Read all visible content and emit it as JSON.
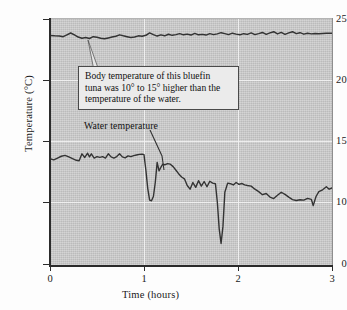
{
  "chart_data": {
    "type": "line",
    "title": "",
    "xlabel": "Time (hours)",
    "ylabel": "Temperature (°C)",
    "xlim": [
      0,
      3
    ],
    "ylim": [
      0,
      25
    ],
    "y_axis_break": true,
    "xticks": [
      "0",
      "1",
      "2",
      "3"
    ],
    "yticks": [
      "0",
      "10",
      "15",
      "20",
      "25"
    ],
    "grid": "white gridlines at y=10,15,20 and x=1,2",
    "legend": "none (inline labels)",
    "plot_background": "#c9c9c9",
    "line_color": "#333333",
    "series": [
      {
        "name": "Body temperature",
        "x": [
          0.0,
          0.05,
          0.1,
          0.14,
          0.18,
          0.22,
          0.26,
          0.3,
          0.34,
          0.38,
          0.42,
          0.46,
          0.5,
          0.54,
          0.58,
          0.62,
          0.66,
          0.7,
          0.74,
          0.78,
          0.82,
          0.86,
          0.9,
          0.94,
          0.98,
          1.02,
          1.06,
          1.1,
          1.14,
          1.18,
          1.22,
          1.26,
          1.3,
          1.34,
          1.38,
          1.42,
          1.46,
          1.5,
          1.54,
          1.58,
          1.62,
          1.66,
          1.7,
          1.74,
          1.78,
          1.82,
          1.86,
          1.9,
          1.94,
          1.98,
          2.02,
          2.06,
          2.1,
          2.14,
          2.18,
          2.22,
          2.26,
          2.3,
          2.34,
          2.38,
          2.42,
          2.46,
          2.5,
          2.54,
          2.58,
          2.62,
          2.66,
          2.7,
          2.74,
          2.78,
          2.82,
          2.86,
          2.9,
          2.94,
          3.0
        ],
        "y": [
          23.65,
          23.62,
          23.6,
          23.55,
          23.7,
          23.85,
          23.7,
          23.52,
          23.42,
          23.48,
          23.4,
          23.55,
          23.5,
          23.42,
          23.38,
          23.45,
          23.52,
          23.58,
          23.7,
          23.62,
          23.55,
          23.48,
          23.52,
          23.62,
          23.58,
          23.66,
          23.86,
          23.72,
          23.6,
          23.7,
          23.62,
          23.75,
          23.66,
          23.72,
          23.8,
          23.7,
          23.76,
          23.68,
          23.82,
          23.7,
          23.74,
          23.68,
          23.8,
          23.72,
          23.78,
          23.88,
          23.8,
          23.72,
          23.84,
          23.76,
          23.7,
          23.8,
          23.74,
          23.86,
          23.72,
          23.8,
          23.9,
          23.74,
          23.86,
          23.96,
          23.78,
          23.9,
          23.74,
          23.86,
          23.96,
          23.8,
          23.88,
          23.76,
          23.84,
          23.78,
          23.82,
          23.8,
          23.82,
          23.84,
          23.84
        ]
      },
      {
        "name": "Water temperature",
        "x": [
          0.0,
          0.04,
          0.08,
          0.12,
          0.16,
          0.2,
          0.24,
          0.28,
          0.31,
          0.34,
          0.37,
          0.4,
          0.42,
          0.44,
          0.47,
          0.5,
          0.53,
          0.56,
          0.59,
          0.62,
          0.65,
          0.68,
          0.71,
          0.74,
          0.77,
          0.8,
          0.83,
          0.86,
          0.89,
          0.92,
          0.95,
          0.98,
          1.0,
          1.02,
          1.04,
          1.06,
          1.08,
          1.1,
          1.12,
          1.14,
          1.16,
          1.18,
          1.2,
          1.22,
          1.25,
          1.28,
          1.31,
          1.34,
          1.37,
          1.4,
          1.43,
          1.46,
          1.49,
          1.52,
          1.55,
          1.58,
          1.61,
          1.64,
          1.67,
          1.7,
          1.73,
          1.76,
          1.78,
          1.8,
          1.82,
          1.84,
          1.86,
          1.89,
          1.92,
          1.95,
          1.98,
          2.01,
          2.04,
          2.07,
          2.1,
          2.14,
          2.18,
          2.22,
          2.26,
          2.3,
          2.34,
          2.38,
          2.42,
          2.46,
          2.5,
          2.54,
          2.58,
          2.62,
          2.66,
          2.7,
          2.74,
          2.78,
          2.8,
          2.83,
          2.86,
          2.9,
          2.94,
          2.97,
          3.0
        ],
        "y": [
          13.55,
          13.45,
          13.6,
          13.75,
          13.82,
          13.7,
          13.55,
          13.42,
          13.38,
          13.95,
          13.65,
          14.0,
          13.7,
          13.95,
          13.6,
          13.72,
          13.66,
          13.72,
          13.6,
          13.95,
          13.7,
          13.6,
          13.72,
          13.95,
          13.7,
          13.62,
          13.78,
          13.72,
          13.8,
          13.85,
          13.9,
          13.92,
          13.88,
          12.6,
          11.1,
          10.15,
          10.1,
          10.45,
          11.6,
          13.25,
          12.55,
          12.85,
          13.1,
          13.05,
          13.15,
          13.1,
          12.9,
          12.6,
          12.3,
          12.05,
          11.9,
          11.35,
          11.05,
          11.6,
          11.2,
          11.75,
          11.3,
          11.68,
          11.25,
          11.7,
          11.55,
          11.5,
          10.0,
          7.8,
          6.6,
          8.0,
          10.8,
          11.55,
          11.5,
          11.4,
          11.6,
          11.45,
          11.52,
          11.4,
          11.35,
          11.3,
          11.05,
          10.85,
          10.6,
          10.7,
          10.4,
          10.28,
          10.55,
          10.8,
          10.62,
          10.4,
          10.2,
          10.12,
          10.18,
          10.15,
          10.3,
          10.22,
          9.7,
          10.45,
          10.85,
          11.0,
          11.25,
          11.05,
          11.15
        ]
      }
    ],
    "annotations": [
      {
        "name": "body-temperature-callout",
        "text": "Body temperature of this bluefin tuna was 10° to 15° higher than the temperature of the water.",
        "lines": [
          "Body temperature of this bluefin",
          "tuna was 10° to 15° higher than the",
          "temperature of the water."
        ],
        "points_to": "body temperature curve near x=0.40"
      },
      {
        "name": "water-temperature-label",
        "text": "Water temperature",
        "points_to": "water temperature curve near x=1.18"
      }
    ]
  },
  "axis": {
    "y_label": "Temperature (°C)",
    "x_label": "Time (hours)",
    "y_ticks": [
      {
        "value": 25,
        "label": "25",
        "top": 19
      },
      {
        "value": 20,
        "label": "20",
        "top": 80
      },
      {
        "value": 15,
        "label": "15",
        "top": 141
      },
      {
        "value": 10,
        "label": "10",
        "top": 202
      },
      {
        "value": 0,
        "label": "0",
        "top": 264
      }
    ],
    "x_ticks": [
      {
        "value": 0,
        "label": "0",
        "left": 50
      },
      {
        "value": 1,
        "label": "1",
        "left": 144
      },
      {
        "value": 2,
        "label": "2",
        "left": 238
      },
      {
        "value": 3,
        "label": "3",
        "left": 332
      }
    ]
  }
}
